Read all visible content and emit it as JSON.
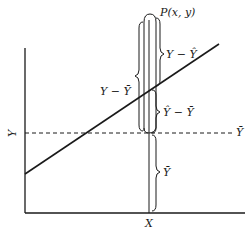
{
  "diagram": {
    "labels": {
      "point": "P(x, y)",
      "residual": "Y − Ŷ",
      "total_deviation": "Y − Ȳ",
      "explained": "Ŷ − Ȳ",
      "mean_line": "Ȳ",
      "mean_height": "Ȳ",
      "x_axis": "X",
      "y_axis": "Y"
    },
    "colors": {
      "stroke": "#1a1a1a",
      "background": "#ffffff"
    }
  }
}
